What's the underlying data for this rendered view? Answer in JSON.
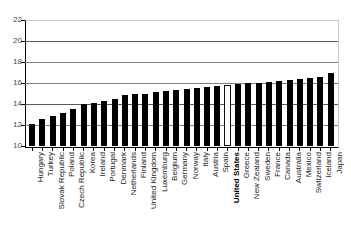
{
  "chart_data": {
    "type": "bar",
    "title": "",
    "subtitle": "",
    "xlabel": "",
    "ylabel": "",
    "ylim": [
      10,
      22
    ],
    "yticks": [
      10,
      12,
      14,
      16,
      18,
      20,
      22
    ],
    "grid": true,
    "legend": null,
    "highlight_category": "United States",
    "categories": [
      "Hungary",
      "Turkey",
      "Slovak Republic",
      "Poland",
      "Czech Republic",
      "Korea",
      "Ireland",
      "Portugal",
      "Denmark",
      "Netherlands",
      "Finland",
      "United Kingdom",
      "Luxemburg",
      "Belgium",
      "Germany",
      "Norway",
      "Italy",
      "Austria",
      "Spain",
      "United States",
      "Greece",
      "New Zealand",
      "Sweden",
      "France",
      "Canada",
      "Australia",
      "Mexico",
      "Switzerland",
      "Iceland",
      "Japan"
    ],
    "values": [
      12.1,
      12.6,
      12.9,
      13.1,
      13.5,
      14.0,
      14.1,
      14.3,
      14.5,
      14.9,
      15.0,
      15.0,
      15.1,
      15.2,
      15.3,
      15.4,
      15.5,
      15.6,
      15.7,
      15.8,
      15.9,
      16.0,
      16.0,
      16.1,
      16.2,
      16.3,
      16.4,
      16.5,
      16.6,
      17.0
    ]
  },
  "axis": {
    "y_tick_labels": [
      "22",
      "20",
      "18",
      "16",
      "14",
      "12",
      "10"
    ]
  }
}
